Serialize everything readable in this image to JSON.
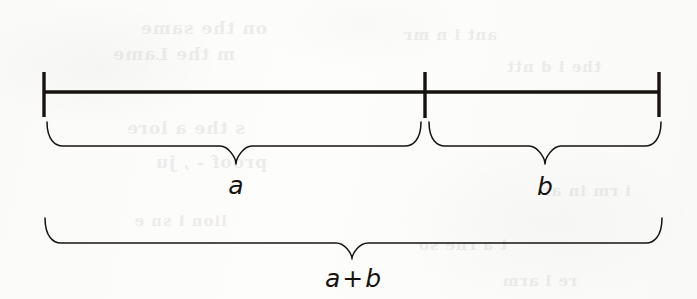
{
  "figure": {
    "caption": "A line segment divided into two parts of length a and b, with a brace under each part and a third brace under the whole showing total length a + b.",
    "background_color": "#fbfbfa",
    "ink_color": "#16120f",
    "canvas": {
      "width": 697,
      "height": 299
    }
  },
  "segment": {
    "name": "measured-segment",
    "axis_y": 92,
    "stroke_width": 3.4,
    "x_start": 44,
    "x_mid": 425,
    "x_end": 659,
    "ticks": [
      {
        "id": "tick-left",
        "x": 44,
        "y_top": 72,
        "y_bottom": 117,
        "stroke_width": 3.4
      },
      {
        "id": "tick-middle",
        "x": 425,
        "y_top": 72,
        "y_bottom": 118,
        "stroke_width": 3.4
      },
      {
        "id": "tick-right",
        "x": 659,
        "y_top": 72,
        "y_bottom": 117,
        "stroke_width": 3.4
      }
    ]
  },
  "braces": [
    {
      "id": "brace-a",
      "label": "a",
      "x_left": 47,
      "x_right": 421,
      "x_peak": 236,
      "y_top": 122,
      "y_shoulder": 146,
      "y_peak": 164,
      "stroke_width": 1.5,
      "label_x": 236,
      "label_y": 185
    },
    {
      "id": "brace-b",
      "label": "b",
      "x_left": 429,
      "x_right": 661,
      "x_peak": 545,
      "y_top": 122,
      "y_shoulder": 146,
      "y_peak": 164,
      "stroke_width": 1.5,
      "label_x": 545,
      "label_y": 186
    },
    {
      "id": "brace-total",
      "label": "a + b",
      "x_left": 45,
      "x_right": 662,
      "x_peak": 352,
      "y_top": 218,
      "y_shoulder": 243,
      "y_peak": 259,
      "stroke_width": 1.5,
      "label_x": 353,
      "label_y": 278
    }
  ],
  "labels": {
    "a": "a",
    "b": "b",
    "sum_left": "a",
    "sum_operator": "+",
    "sum_right": "b"
  },
  "bleed_through": [
    {
      "text": "on the same",
      "x": 430,
      "y": 18,
      "size": 17
    },
    {
      "text": "m the Lame",
      "x": 462,
      "y": 44,
      "size": 17
    },
    {
      "text": "ant i n mr",
      "x": 200,
      "y": 26,
      "size": 15
    },
    {
      "text": "the i d ntt",
      "x": 96,
      "y": 58,
      "size": 15
    },
    {
      "text": "s the a lore",
      "x": 452,
      "y": 118,
      "size": 17
    },
    {
      "text": "proof - , ju",
      "x": 430,
      "y": 152,
      "size": 17
    },
    {
      "text": "i rm in  ar",
      "x": 66,
      "y": 182,
      "size": 15
    },
    {
      "text": "t a rne  so",
      "x": 190,
      "y": 236,
      "size": 15
    },
    {
      "text": "lion  i sn e",
      "x": 470,
      "y": 212,
      "size": 15
    },
    {
      "text": "re  l arm",
      "x": 120,
      "y": 272,
      "size": 15
    }
  ]
}
